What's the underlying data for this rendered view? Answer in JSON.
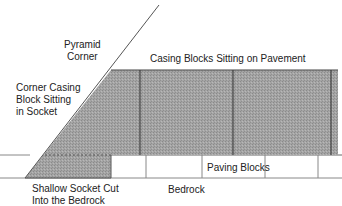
{
  "diagram": {
    "labels": {
      "pyramid_corner": [
        "Pyramid",
        "Corner"
      ],
      "casing_blocks": "Casing Blocks Sitting on Pavement",
      "corner_casing": [
        "Corner Casing",
        "Block Sitting",
        "in Socket"
      ],
      "paving_blocks": "Paving Blocks",
      "bedrock": "Bedrock",
      "socket": [
        "Shallow Socket Cut",
        "Into the Bedrock"
      ]
    },
    "colors": {
      "shading": "#9a9a9a",
      "line": "#333333",
      "thin_line": "#888888"
    }
  }
}
